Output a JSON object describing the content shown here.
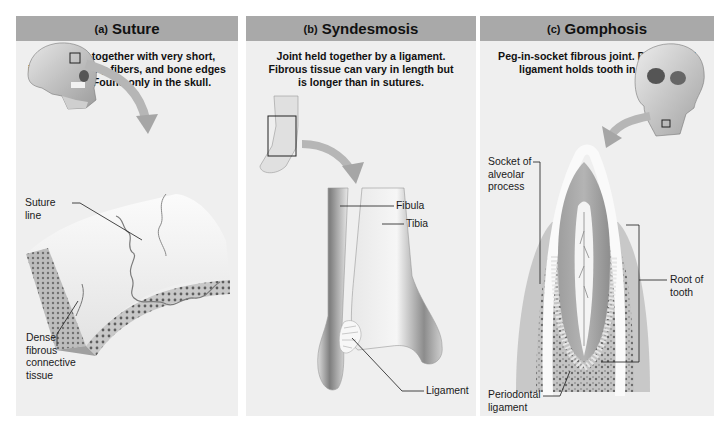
{
  "figure": {
    "panels": [
      {
        "letter": "(a)",
        "title": "Suture",
        "description": "Joint held together with very short,\ninterconnecting fibers, and bone edges\ninterlock. Found only in the skull.",
        "labels": [
          {
            "text": "Suture\nline"
          },
          {
            "text": "Dense\nfibrous\nconnective\ntissue"
          }
        ]
      },
      {
        "letter": "(b)",
        "title": "Syndesmosis",
        "description": "Joint held together by a ligament.\nFibrous tissue can vary in length but\nis longer than in sutures.",
        "labels": [
          {
            "text": "Fibula"
          },
          {
            "text": "Tibia"
          },
          {
            "text": "Ligament"
          }
        ]
      },
      {
        "letter": "(c)",
        "title": "Gomphosis",
        "description": "Peg-in-socket fibrous joint. Periodontal\nligament holds tooth in socket.",
        "labels": [
          {
            "text": "Socket of\nalveolar\nprocess"
          },
          {
            "text": "Root of\ntooth"
          },
          {
            "text": "Periodontal\nligament"
          }
        ]
      }
    ],
    "colors": {
      "header_bg": "#a9a9a9",
      "panel_bg": "#efefef",
      "leader_line": "#1a1a1a",
      "bone_light": "#f4f4f4",
      "bone_shade": "#9a9a9a"
    }
  }
}
